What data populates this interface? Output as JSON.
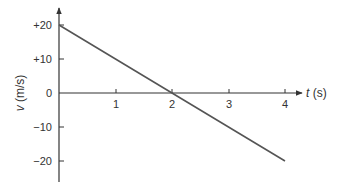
{
  "chart_data": {
    "type": "line",
    "title": "",
    "xlabel": "t (s)",
    "xlabel_var": "t",
    "xlabel_unit": "(s)",
    "ylabel": "v (m/s)",
    "ylabel_var": "v",
    "ylabel_unit": "(m/s)",
    "xlim": [
      0,
      4.3
    ],
    "ylim": [
      -26,
      26
    ],
    "grid": false,
    "legend": null,
    "x_ticks": [
      "1",
      "2",
      "3",
      "4"
    ],
    "y_ticks": [
      "+20",
      "+10",
      "0",
      "−10",
      "−20"
    ],
    "series": [
      {
        "name": "velocity",
        "x": [
          0,
          1,
          2,
          3,
          4
        ],
        "y": [
          20,
          10,
          0,
          -10,
          -20
        ],
        "color": "#555555"
      }
    ]
  }
}
